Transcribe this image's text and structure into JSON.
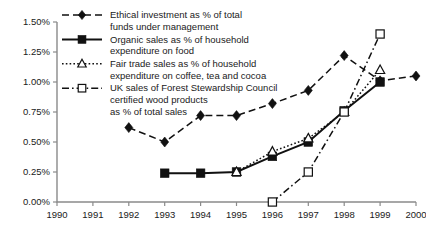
{
  "chart_data": {
    "type": "line",
    "title": "",
    "subtitle": "",
    "xlabel": "",
    "ylabel": "",
    "x": [
      1990,
      1991,
      1992,
      1993,
      1994,
      1995,
      1996,
      1997,
      1998,
      1999,
      2000
    ],
    "xtick_labels": [
      "1990",
      "1991",
      "1992",
      "1993",
      "1994",
      "1995",
      "1996",
      "1997",
      "1998",
      "1999",
      "2000"
    ],
    "xlim": [
      1990,
      2000
    ],
    "ylim": [
      0.0,
      1.5
    ],
    "ytick_labels": [
      "0.00%",
      "0.25%",
      "0.50%",
      "0.75%",
      "1.00%",
      "1.25%",
      "1.50%"
    ],
    "ytick_values": [
      0.0,
      0.25,
      0.5,
      0.75,
      1.0,
      1.25,
      1.5
    ],
    "yunit": "%",
    "grid": false,
    "legend_position": "top-right-inside",
    "series": [
      {
        "name": "Ethical investment as % of total funds under management",
        "marker": "filled-diamond",
        "linestyle": "dashed",
        "color": "#111111",
        "x": [
          1992,
          1993,
          1994,
          1995,
          1996,
          1997,
          1998,
          1999,
          2000
        ],
        "values": [
          0.62,
          0.5,
          0.72,
          0.72,
          0.82,
          0.93,
          1.22,
          1.01,
          1.05
        ]
      },
      {
        "name": "Organic sales as % of household expenditure on food",
        "marker": "filled-square",
        "linestyle": "solid",
        "color": "#111111",
        "x": [
          1993,
          1994,
          1995,
          1996,
          1997,
          1998,
          1999
        ],
        "values": [
          0.24,
          0.24,
          0.25,
          0.38,
          0.5,
          0.76,
          1.0
        ]
      },
      {
        "name": "Fair trade sales as % of household expenditure on coffee, tea and cocoa",
        "marker": "open-triangle",
        "linestyle": "dotted",
        "color": "#111111",
        "x": [
          1995,
          1996,
          1997,
          1998,
          1999
        ],
        "values": [
          0.25,
          0.42,
          0.53,
          0.75,
          1.1
        ]
      },
      {
        "name": "UK sales of Forest Stewardship Council certified wood products as % of total sales",
        "marker": "open-square",
        "linestyle": "dash-dot",
        "color": "#111111",
        "x": [
          1996,
          1997,
          1998,
          1999
        ],
        "values": [
          0.0,
          0.25,
          0.75,
          1.4
        ]
      }
    ],
    "legend": [
      {
        "key": "ethical-investment",
        "marker": "filled-diamond",
        "linestyle": "dashed",
        "lines": [
          "Ethical investment as % of total",
          "funds under management"
        ]
      },
      {
        "key": "organic-sales",
        "marker": "filled-square",
        "linestyle": "solid",
        "lines": [
          "Organic sales as % of household",
          "expenditure on food"
        ]
      },
      {
        "key": "fair-trade-sales",
        "marker": "open-triangle",
        "linestyle": "dotted",
        "lines": [
          "Fair trade sales as % of household",
          "expenditure on coffee, tea and cocoa"
        ]
      },
      {
        "key": "fsc-wood-products",
        "marker": "open-square",
        "linestyle": "dash-dot",
        "lines": [
          "UK sales of Forest Stewardship Council",
          "certified wood products",
          "as % of total sales"
        ]
      }
    ]
  }
}
